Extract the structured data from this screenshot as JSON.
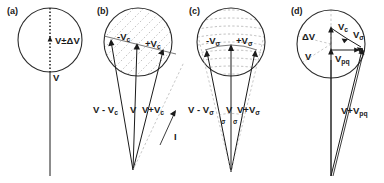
{
  "figure": {
    "background": "#ffffff",
    "ink_color": "#1a1a1a",
    "guide_color": "#9a9a9a",
    "panel_count": 4
  },
  "panels": [
    {
      "id": "a",
      "label": "(a)",
      "description": "circle with vertical dotted diameter and single velocity vector",
      "labels": [
        {
          "name": "v-plus-minus-delta-v",
          "text": "V±ΔV"
        },
        {
          "name": "v",
          "text": "V"
        }
      ]
    },
    {
      "id": "b",
      "label": "(b)",
      "description": "circle with diagonal dashed hatching, three vectors from a common apex",
      "labels": [
        {
          "name": "minus-vc",
          "base": "-V",
          "sub": "c"
        },
        {
          "name": "plus-vc",
          "base": "+V",
          "sub": "c"
        },
        {
          "name": "v-minus-vc",
          "base": "V - V",
          "sub": "c"
        },
        {
          "name": "v",
          "base": "V",
          "sub": ""
        },
        {
          "name": "v-plus-vc",
          "base": "V+V",
          "sub": "c"
        },
        {
          "name": "current-i",
          "base": "I",
          "sub": ""
        }
      ]
    },
    {
      "id": "c",
      "label": "(c)",
      "description": "circle with horizontal dashed latitude arcs, three vectors from a common apex with angle sigma marked",
      "labels": [
        {
          "name": "minus-v-sigma",
          "base": "-V",
          "sub": "σ"
        },
        {
          "name": "plus-v-sigma",
          "base": "+V",
          "sub": "σ"
        },
        {
          "name": "v-minus-v-sigma",
          "base": "V - V",
          "sub": "σ"
        },
        {
          "name": "v",
          "base": "V",
          "sub": ""
        },
        {
          "name": "v-plus-v-sigma",
          "base": "V+V",
          "sub": "σ"
        },
        {
          "name": "angle-sigma-left",
          "base": "σ",
          "sub": ""
        },
        {
          "name": "angle-sigma-right",
          "base": "σ",
          "sub": ""
        }
      ]
    },
    {
      "id": "d",
      "label": "(d)",
      "description": "circle with light dashed radii, resultant vector construction",
      "labels": [
        {
          "name": "delta-v",
          "base": "ΔV",
          "sub": ""
        },
        {
          "name": "vc",
          "base": "V",
          "sub": "c"
        },
        {
          "name": "v-sigma",
          "base": "V",
          "sub": "σ"
        },
        {
          "name": "v",
          "base": "V",
          "sub": ""
        },
        {
          "name": "v-pq",
          "base": "V",
          "sub": "pq"
        },
        {
          "name": "v-plus-v-pq",
          "base": "V+V",
          "sub": "pq"
        }
      ]
    }
  ]
}
